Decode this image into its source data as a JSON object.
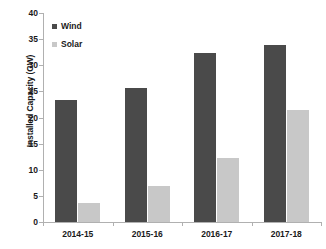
{
  "chart_data": {
    "type": "bar",
    "title": "",
    "xlabel": "",
    "ylabel": "Installed Capacity (GW)",
    "categories": [
      "2014-15",
      "2015-16",
      "2016-17",
      "2017-18"
    ],
    "series": [
      {
        "name": "Wind",
        "color": "#4a4a4a",
        "values": [
          23.3,
          25.7,
          32.3,
          33.8
        ]
      },
      {
        "name": "Solar",
        "color": "#c8c8c8",
        "values": [
          3.7,
          6.8,
          12.3,
          21.4
        ]
      }
    ],
    "ylim": [
      0,
      40
    ],
    "yticks": [
      0,
      5,
      10,
      15,
      20,
      25,
      30,
      35,
      40
    ],
    "ytick_labels": [
      "0",
      "5",
      "10",
      "15",
      "20",
      "25",
      "30",
      "35",
      "40"
    ],
    "grid": false,
    "legend_position": "inside-top-left",
    "legend": [
      "Wind",
      "Solar"
    ]
  },
  "axis": {
    "y_title": "Installed Capacity (GW)"
  },
  "legend": {
    "wind_label": "Wind",
    "solar_label": "Solar"
  }
}
